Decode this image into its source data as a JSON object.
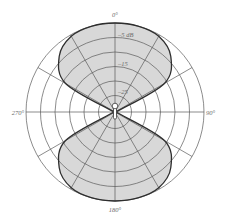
{
  "chart_data": {
    "type": "line",
    "projection": "polar",
    "title": "",
    "pattern": "bidirectional (figure-8)",
    "angle_unit": "degrees",
    "angle_direction": "clockwise, 0° at top",
    "angle_labels": [
      {
        "angle": 0,
        "label": "0°"
      },
      {
        "angle": 90,
        "label": "90°"
      },
      {
        "angle": 180,
        "label": "180°"
      },
      {
        "angle": 270,
        "label": "270°"
      }
    ],
    "radial_axis": {
      "unit": "dB",
      "range": [
        -30,
        0
      ],
      "rings_db": [
        0,
        -5,
        -10,
        -15,
        -20,
        -25
      ],
      "ring_labels": [
        {
          "db": -5,
          "label": "–5 dB"
        },
        {
          "db": -15,
          "label": "–15"
        },
        {
          "db": -25,
          "label": "–25"
        }
      ]
    },
    "spokes_every_deg": 30,
    "grid": true,
    "legend": null,
    "series": [
      {
        "name": "polar response",
        "angles": [
          0,
          15,
          30,
          45,
          60,
          75,
          90,
          105,
          120,
          135,
          150,
          165,
          180,
          195,
          210,
          225,
          240,
          255,
          270,
          285,
          300,
          315,
          330,
          345
        ],
        "values_db": [
          0,
          0,
          -0.5,
          -3.5,
          -11,
          -30,
          -30,
          -30,
          -11,
          -3.5,
          -0.5,
          0,
          0,
          0,
          -0.5,
          -3.5,
          -11,
          -30,
          -30,
          -30,
          -11,
          -3.5,
          -0.5,
          0
        ]
      }
    ]
  },
  "labels": {
    "top": "0°",
    "right": "90°",
    "bottom": "180°",
    "left": "270°",
    "ring_5": "–5 dB",
    "ring_15": "–15",
    "ring_25": "–25"
  },
  "style": {
    "fill": "#d8d8d8",
    "outline": "#2e2e2e",
    "grid": "#5a5a5a",
    "label": "#6a6a6a"
  },
  "icons": {
    "center": "microphone-icon"
  }
}
